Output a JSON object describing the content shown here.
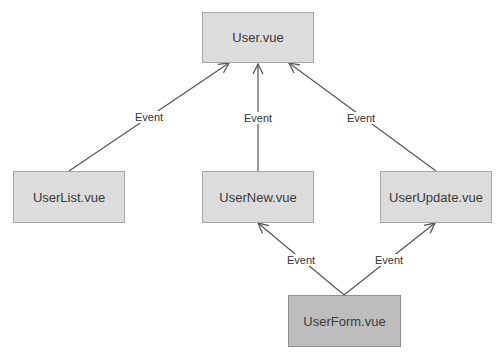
{
  "diagram": {
    "nodes": [
      {
        "id": "user",
        "label": "User.vue"
      },
      {
        "id": "userlist",
        "label": "UserList.vue"
      },
      {
        "id": "usernew",
        "label": "UserNew.vue"
      },
      {
        "id": "userupdate",
        "label": "UserUpdate.vue"
      },
      {
        "id": "userform",
        "label": "UserForm.vue"
      }
    ],
    "edges": [
      {
        "from": "userlist",
        "to": "user",
        "label": "Event"
      },
      {
        "from": "usernew",
        "to": "user",
        "label": "Event"
      },
      {
        "from": "userupdate",
        "to": "user",
        "label": "Event"
      },
      {
        "from": "userform",
        "to": "usernew",
        "label": "Event"
      },
      {
        "from": "userform",
        "to": "userupdate",
        "label": "Event"
      }
    ],
    "colors": {
      "node_fill": "#dcdcdc",
      "highlight_node_fill": "#bdbdbd",
      "edge": "#555555"
    }
  }
}
